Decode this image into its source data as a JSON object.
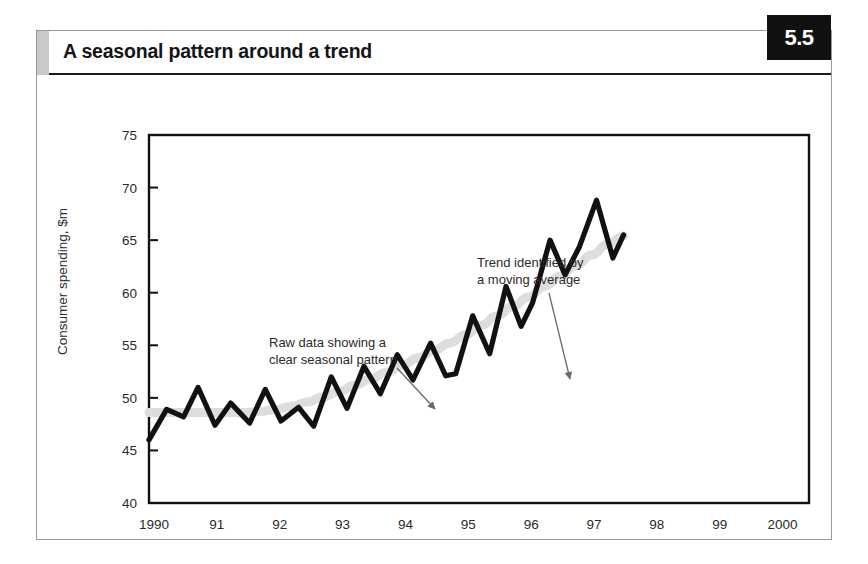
{
  "header": {
    "title": "A seasonal pattern around a trend",
    "badge": "5.5"
  },
  "colors": {
    "series_line": "#111111",
    "trend_line": "#dddddd",
    "axis": "#111111",
    "text": "#2b2b2b",
    "badge_bg": "#111111",
    "badge_text": "#ffffff",
    "frame": "#9a9a9a",
    "header_accent": "#c9c9c9"
  },
  "annotations": [
    {
      "name": "raw-data-annotation",
      "line1": "Raw data showing a",
      "line2": "clear seasonal pattern",
      "text_x": 232,
      "text_y": 272,
      "arrow": {
        "x1": 360,
        "y1": 293,
        "x2": 398,
        "y2": 334
      }
    },
    {
      "name": "trend-annotation",
      "line1": "Trend identified by",
      "line2": "a moving average",
      "text_x": 440,
      "text_y": 192,
      "arrow": {
        "x1": 512,
        "y1": 218,
        "x2": 533,
        "y2": 304
      }
    }
  ],
  "chart_data": {
    "type": "line",
    "title": "A seasonal pattern around a trend",
    "xlabel": "",
    "ylabel": "Consumer spending, $m",
    "ylim": [
      40,
      75
    ],
    "yticks": [
      40,
      45,
      50,
      55,
      60,
      65,
      70,
      75
    ],
    "xticks": [
      "1990",
      "91",
      "92",
      "93",
      "94",
      "95",
      "96",
      "97",
      "98",
      "99",
      "2000"
    ],
    "xtick_values": [
      1990,
      1991,
      1992,
      1993,
      1994,
      1995,
      1996,
      1997,
      1998,
      1999,
      2000
    ],
    "xlim": [
      1990,
      2000.5
    ],
    "grid": false,
    "legend": "none",
    "frequency": "quarterly",
    "x": [
      1990.0,
      1990.25,
      1990.5,
      1990.75,
      1991.0,
      1991.25,
      1991.5,
      1991.75,
      1992.0,
      1992.25,
      1992.5,
      1992.75,
      1993.0,
      1993.25,
      1993.5,
      1993.75,
      1994.0,
      1994.25,
      1994.5,
      1994.75,
      1995.0,
      1995.25,
      1995.5,
      1995.75,
      1996.0,
      1996.25,
      1996.5,
      1996.75,
      1997.0,
      1997.25,
      1997.5,
      1997.75,
      1998.0,
      1998.25,
      1998.5,
      1998.75,
      1999.0,
      1999.25,
      1999.5,
      1999.75,
      2000.0,
      2000.25
    ],
    "series": [
      {
        "name": "Raw data",
        "style": "thick-black",
        "values": [
          46.0,
          48.9,
          48.2,
          51.0,
          47.4,
          49.5,
          47.6,
          50.8,
          47.8,
          49.1,
          47.3,
          52.0,
          49.0,
          53.0,
          50.4,
          54.1,
          51.7,
          55.2,
          52.1,
          52.3,
          57.8,
          54.2,
          60.6,
          56.8,
          59.0,
          65.0,
          61.7,
          64.4,
          68.8,
          63.3,
          65.5,
          65.5,
          65.5,
          65.5,
          65.5,
          65.5,
          65.5,
          65.5,
          65.5,
          65.5,
          65.5,
          65.5
        ]
      },
      {
        "name": "Trend (moving average)",
        "style": "thick-light-gray",
        "values": [
          48.6,
          48.6,
          48.6,
          48.6,
          48.6,
          48.6,
          48.6,
          48.7,
          48.9,
          49.2,
          49.6,
          50.1,
          50.6,
          51.2,
          51.8,
          52.4,
          53.1,
          53.8,
          54.5,
          55.2,
          56.0,
          56.9,
          57.8,
          58.7,
          59.6,
          60.6,
          61.6,
          62.6,
          63.6,
          64.6,
          65.4,
          65.4,
          65.4,
          65.4,
          65.4,
          65.4,
          65.4,
          65.4,
          65.4,
          65.4,
          65.4,
          65.4
        ]
      }
    ],
    "raw_points": [
      [
        1990.0,
        46.0
      ],
      [
        1990.28,
        48.9
      ],
      [
        1990.55,
        48.2
      ],
      [
        1990.78,
        51.0
      ],
      [
        1991.05,
        47.4
      ],
      [
        1991.3,
        49.5
      ],
      [
        1991.6,
        47.6
      ],
      [
        1991.85,
        50.8
      ],
      [
        1992.1,
        47.8
      ],
      [
        1992.38,
        49.1
      ],
      [
        1992.62,
        47.3
      ],
      [
        1992.9,
        52.0
      ],
      [
        1993.15,
        49.0
      ],
      [
        1993.42,
        53.0
      ],
      [
        1993.68,
        50.4
      ],
      [
        1993.95,
        54.1
      ],
      [
        1994.2,
        51.7
      ],
      [
        1994.48,
        55.2
      ],
      [
        1994.72,
        52.1
      ],
      [
        1994.88,
        52.3
      ],
      [
        1995.15,
        57.8
      ],
      [
        1995.42,
        54.2
      ],
      [
        1995.68,
        60.6
      ],
      [
        1995.92,
        56.8
      ],
      [
        1996.1,
        59.0
      ],
      [
        1996.38,
        65.0
      ],
      [
        1996.62,
        61.7
      ],
      [
        1996.85,
        64.4
      ],
      [
        1997.12,
        68.8
      ],
      [
        1997.38,
        63.3
      ],
      [
        1997.55,
        65.5
      ]
    ]
  }
}
